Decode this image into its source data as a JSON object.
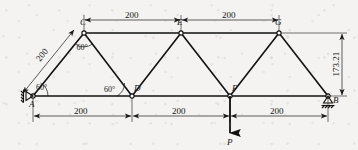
{
  "figure": {
    "type": "truss-diagram",
    "units_note": "",
    "colors": {
      "line": "#111111",
      "text": "#141414",
      "background": "#f4f3f1"
    }
  },
  "nodes": [
    {
      "id": "A",
      "label": "A",
      "x": 33,
      "y": 96,
      "support": "pin"
    },
    {
      "id": "C",
      "label": "C",
      "x": 84,
      "y": 33,
      "support": "none"
    },
    {
      "id": "D",
      "label": "D",
      "x": 132,
      "y": 96,
      "support": "none"
    },
    {
      "id": "E",
      "label": "E",
      "x": 181,
      "y": 33,
      "support": "none"
    },
    {
      "id": "F",
      "label": "F",
      "x": 230,
      "y": 96,
      "support": "none"
    },
    {
      "id": "G",
      "label": "G",
      "x": 279,
      "y": 33,
      "support": "none"
    },
    {
      "id": "B",
      "label": "B",
      "x": 328,
      "y": 96,
      "support": "roller"
    }
  ],
  "members": [
    {
      "from": "A",
      "to": "C"
    },
    {
      "from": "C",
      "to": "D"
    },
    {
      "from": "D",
      "to": "E"
    },
    {
      "from": "E",
      "to": "F"
    },
    {
      "from": "F",
      "to": "G"
    },
    {
      "from": "G",
      "to": "B"
    },
    {
      "from": "A",
      "to": "D"
    },
    {
      "from": "D",
      "to": "F"
    },
    {
      "from": "F",
      "to": "B"
    },
    {
      "from": "C",
      "to": "E"
    },
    {
      "from": "E",
      "to": "G"
    }
  ],
  "dimensions": {
    "top": [
      {
        "label": "200",
        "from": "C",
        "to": "E"
      },
      {
        "label": "200",
        "from": "E",
        "to": "G"
      }
    ],
    "bottom": [
      {
        "label": "200",
        "from": "A",
        "to": "D"
      },
      {
        "label": "200",
        "from": "D",
        "to": "F"
      },
      {
        "label": "200",
        "from": "F",
        "to": "B"
      }
    ],
    "diagonal": {
      "label": "200",
      "from": "A",
      "to": "C"
    },
    "vertical": {
      "label": "173.21",
      "from": "G",
      "to": "B"
    }
  },
  "angles": [
    {
      "label": "60°",
      "at": "A"
    },
    {
      "label": "60°",
      "at": "C"
    },
    {
      "label": "60°",
      "at": "D"
    }
  ],
  "load": {
    "label": "P",
    "at": "F",
    "direction": "down"
  }
}
